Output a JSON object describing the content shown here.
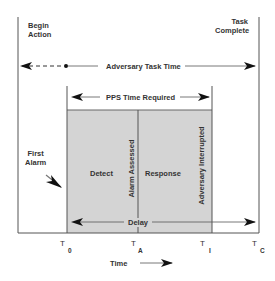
{
  "diagram": {
    "labels": {
      "begin_action": [
        "Begin",
        "Action"
      ],
      "task_complete": [
        "Task",
        "Complete"
      ],
      "adversary_task_time": "Adversary Task Time",
      "pps_time_required": "PPS Time Required",
      "first_alarm": [
        "First",
        "Alarm"
      ],
      "detect": "Detect",
      "alarm_assessed": "Alarm Assessed",
      "response": "Response",
      "adversary_interrupted": "Adversary Interrupted",
      "delay": "Delay",
      "time": "Time"
    },
    "time_marks": [
      {
        "letter": "T",
        "sub": "0"
      },
      {
        "letter": "T",
        "sub": "A"
      },
      {
        "letter": "T",
        "sub": "I"
      },
      {
        "letter": "T",
        "sub": "C"
      }
    ],
    "colors": {
      "box_fill": "#d4d4d4",
      "lines": "#444444",
      "background": "#ffffff"
    }
  }
}
